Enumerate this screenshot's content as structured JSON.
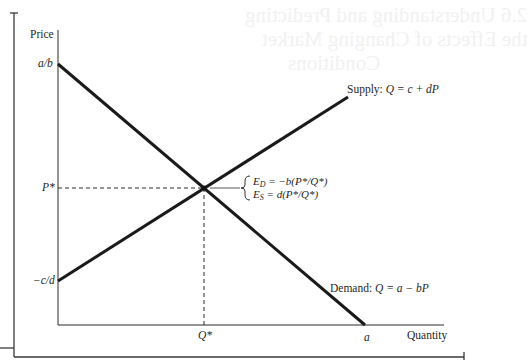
{
  "figure": {
    "axes": {
      "y_label": "Price",
      "x_label": "Quantity"
    },
    "y_ticks": {
      "a_over_b": "a/b",
      "p_star": "P*",
      "neg_c_over_d": "−c/d"
    },
    "x_ticks": {
      "q_star": "Q*",
      "a": "a"
    },
    "curves": {
      "supply_label": "Supply: ",
      "supply_eq": "Q = c + dP",
      "demand_label": "Demand: ",
      "demand_eq": "Q = a − bP"
    },
    "elasticities": {
      "ed_lhs": "E",
      "ed_sub": "D",
      "ed_rhs": " = −b(P*/Q*)",
      "es_lhs": "E",
      "es_sub": "S",
      "es_rhs": " = d(P*/Q*)"
    },
    "bleed_through": {
      "line1": "2.6 Understanding and Predicting",
      "line2": "the Effects of Changing Market",
      "line3": "Conditions"
    }
  },
  "colors": {
    "ink": "#1f1f1f",
    "frame": "#3a3a3a",
    "dashed": "#2a2a2a"
  }
}
